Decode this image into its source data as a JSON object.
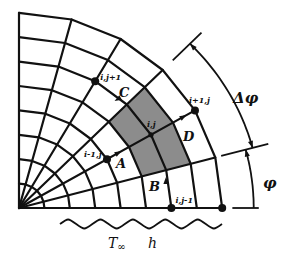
{
  "figure": {
    "type": "polar finite-difference grid (quarter circle)",
    "origin": [
      19,
      208
    ],
    "ring_spacing_x": 25.4,
    "ring_spacing_y": 24.4,
    "rings": 8,
    "angles_deg": [
      0,
      15,
      30,
      45,
      60,
      75,
      90
    ],
    "shade_color": "#8c8c8c",
    "line_color": "#111111",
    "shaded_cell": {
      "ring_from": 5,
      "ring_to": 7,
      "angle_from": 15,
      "angle_to": 45
    }
  },
  "nodes": [
    {
      "id": "ij",
      "label": "i,j",
      "ring": 6,
      "angle": 30,
      "label_dx": -4,
      "label_dy": -8
    },
    {
      "id": "ip1j",
      "label": "i+1,j",
      "ring": 8,
      "angle": 30,
      "label_dx": -6,
      "label_dy": -7
    },
    {
      "id": "im1j",
      "label": "i-1,j",
      "ring": 4,
      "angle": 30,
      "label_dx": -23,
      "label_dy": -2
    },
    {
      "id": "ijp1",
      "label": "i,j+1",
      "ring": 6,
      "angle": 60,
      "label_dx": 5,
      "label_dy": -1
    },
    {
      "id": "ijm1",
      "label": "i,j-1",
      "ring": 6,
      "angle": 0,
      "label_dx": 4,
      "label_dy": -5
    },
    {
      "id": "outer",
      "label": "",
      "ring": 8,
      "angle": 0,
      "label_dx": 0,
      "label_dy": 0
    }
  ],
  "cell_labels": [
    {
      "id": "A",
      "label": "A",
      "x": 116,
      "y": 168
    },
    {
      "id": "B",
      "label": "B",
      "x": 149,
      "y": 191
    },
    {
      "id": "C",
      "label": "C",
      "x": 119,
      "y": 97
    },
    {
      "id": "D",
      "label": "D",
      "x": 183,
      "y": 141
    }
  ],
  "flux_arrows": [
    {
      "id": "A",
      "x": 118,
      "y": 153,
      "rot": -30
    },
    {
      "id": "B",
      "x": 166,
      "y": 181,
      "rot": -90
    },
    {
      "id": "C",
      "x": 118,
      "y": 99,
      "rot": 150
    },
    {
      "id": "D",
      "x": 183,
      "y": 117,
      "rot": -30
    }
  ],
  "dimensions": {
    "delta_phi": {
      "label": "Δφ",
      "from_deg": 15,
      "to_deg": 45,
      "radius_scale": 1.19,
      "label_x": 233,
      "label_y": 103
    },
    "phi": {
      "label": "φ",
      "from_deg": 0,
      "to_deg": 15,
      "radius_scale": 1.155,
      "label_x": 263,
      "label_y": 188
    }
  },
  "boundary": {
    "label_T": "T",
    "label_T_sub": "∞",
    "label_h": "h",
    "wave_x_from": 60,
    "wave_x_to": 222,
    "wave_y": 224,
    "wave_count": 5
  }
}
